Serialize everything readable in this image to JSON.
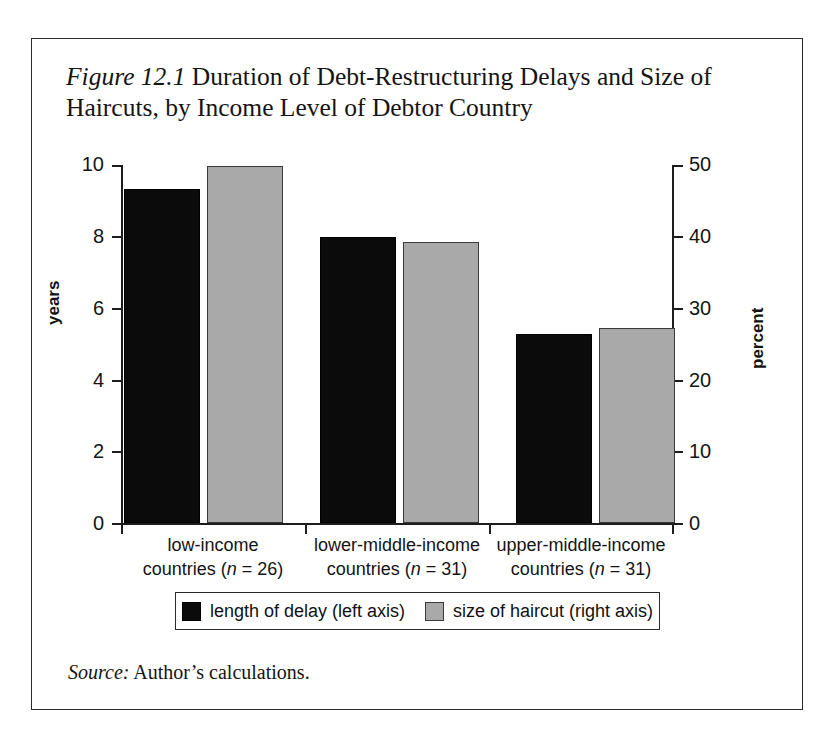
{
  "page_header": {
    "text": "",
    "page_number": ""
  },
  "figure": {
    "label": "Figure 12.1",
    "title": " Duration of Debt-Restructuring Delays and Size of Haircuts, by Income Level of Debtor Country",
    "source_label": "Source:",
    "source_text": " Author’s calculations."
  },
  "chart_data": {
    "type": "bar",
    "title": "Figure 12.1 Duration of Debt-Restructuring Delays and Size of Haircuts, by Income Level of Debtor Country",
    "categories": [
      "low-income countries (n = 26)",
      "lower-middle-income countries (n = 31)",
      "upper-middle-income countries (n = 31)"
    ],
    "category_lines": [
      {
        "line1": "low-income",
        "line2_pre": "countries (",
        "line2_n": "n",
        "line2_post": " = 26)"
      },
      {
        "line1": "lower-middle-income",
        "line2_pre": "countries (",
        "line2_n": "n",
        "line2_post": " = 31)"
      },
      {
        "line1": "upper-middle-income",
        "line2_pre": "countries (",
        "line2_n": "n",
        "line2_post": " = 31)"
      }
    ],
    "series": [
      {
        "name": "length of delay (left axis)",
        "axis": "left",
        "unit": "years",
        "color": "#0b0b0b",
        "values": [
          9.33,
          8.0,
          5.28
        ]
      },
      {
        "name": "size of haircut (right axis)",
        "axis": "right",
        "unit": "percent",
        "color": "#a9a9a9",
        "values": [
          49.9,
          39.2,
          27.2
        ]
      }
    ],
    "xlabel": "",
    "ylabel_left": "years",
    "ylabel_right": "percent",
    "ylim_left": [
      0,
      10
    ],
    "ylim_right": [
      0,
      50
    ],
    "yticks_left": [
      "10",
      "8",
      "6",
      "4",
      "2",
      "0"
    ],
    "yticks_right": [
      "50",
      "40",
      "30",
      "20",
      "10",
      "0"
    ],
    "grid": false,
    "legend_position": "bottom"
  },
  "legend": {
    "items": [
      {
        "label": "length of delay (left axis)",
        "swatch": "black-square"
      },
      {
        "label": "size of haircut (right axis)",
        "swatch": "gray-square"
      }
    ]
  },
  "colors": {
    "delay_bar": "#0b0b0b",
    "haircut_bar": "#a9a9a9",
    "axis": "#1d1d1d",
    "frame": "#2b2b2b",
    "background": "#ffffff"
  }
}
